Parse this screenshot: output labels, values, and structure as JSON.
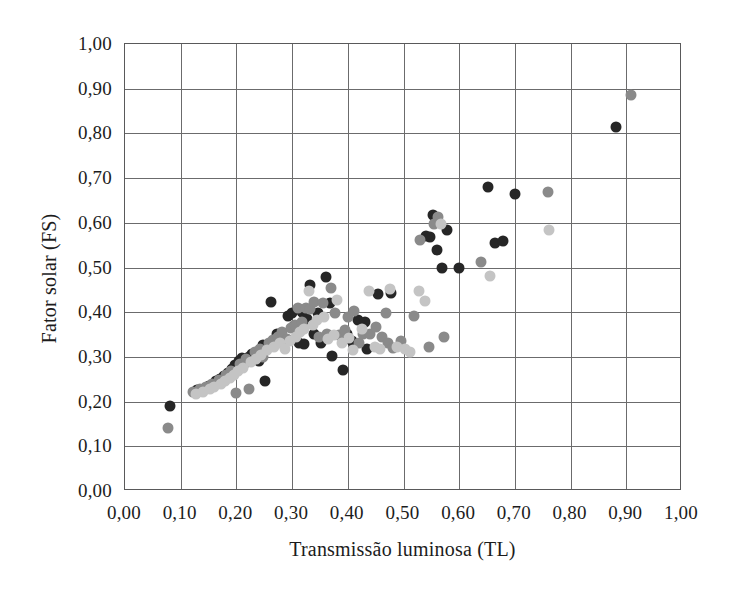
{
  "chart_data": {
    "type": "scatter",
    "title": "",
    "xlabel": "Transmissão luminosa (TL)",
    "ylabel": "Fator solar (FS)",
    "xlim": [
      0.0,
      1.0
    ],
    "ylim": [
      0.0,
      1.0
    ],
    "xticks": [
      "0,00",
      "0,10",
      "0,20",
      "0,30",
      "0,40",
      "0,50",
      "0,60",
      "0,70",
      "0,80",
      "0,90",
      "1,00"
    ],
    "yticks": [
      "0,00",
      "0,10",
      "0,20",
      "0,30",
      "0,40",
      "0,50",
      "0,60",
      "0,70",
      "0,80",
      "0,90",
      "1,00"
    ],
    "xtick_values": [
      0.0,
      0.1,
      0.2,
      0.3,
      0.4,
      0.5,
      0.6,
      0.7,
      0.8,
      0.9,
      1.0
    ],
    "ytick_values": [
      0.0,
      0.1,
      0.2,
      0.3,
      0.4,
      0.5,
      0.6,
      0.7,
      0.8,
      0.9,
      1.0
    ],
    "grid": true,
    "legend": "none",
    "marker_size_px": 11,
    "colors": {
      "dark": "#262626",
      "medium": "#8a8a8a",
      "light": "#c4c4c4",
      "frame": "#59595a",
      "gridline": "#6b6b6c",
      "text": "#1c1c1c",
      "background": "#ffffff"
    },
    "series": [
      {
        "name": "dark",
        "color": "#262626",
        "points": [
          [
            0.08,
            0.19
          ],
          [
            0.13,
            0.225
          ],
          [
            0.15,
            0.235
          ],
          [
            0.163,
            0.245
          ],
          [
            0.17,
            0.25
          ],
          [
            0.178,
            0.258
          ],
          [
            0.185,
            0.265
          ],
          [
            0.192,
            0.272
          ],
          [
            0.198,
            0.282
          ],
          [
            0.205,
            0.29
          ],
          [
            0.21,
            0.297
          ],
          [
            0.213,
            0.285
          ],
          [
            0.222,
            0.3
          ],
          [
            0.228,
            0.307
          ],
          [
            0.24,
            0.29
          ],
          [
            0.247,
            0.327
          ],
          [
            0.252,
            0.245
          ],
          [
            0.262,
            0.422
          ],
          [
            0.272,
            0.352
          ],
          [
            0.285,
            0.33
          ],
          [
            0.292,
            0.392
          ],
          [
            0.3,
            0.398
          ],
          [
            0.303,
            0.37
          ],
          [
            0.312,
            0.33
          ],
          [
            0.318,
            0.4
          ],
          [
            0.322,
            0.328
          ],
          [
            0.327,
            0.385
          ],
          [
            0.333,
            0.46
          ],
          [
            0.34,
            0.352
          ],
          [
            0.347,
            0.398
          ],
          [
            0.352,
            0.33
          ],
          [
            0.36,
            0.478
          ],
          [
            0.368,
            0.42
          ],
          [
            0.372,
            0.302
          ],
          [
            0.392,
            0.27
          ],
          [
            0.398,
            0.352
          ],
          [
            0.407,
            0.335
          ],
          [
            0.418,
            0.382
          ],
          [
            0.43,
            0.378
          ],
          [
            0.435,
            0.318
          ],
          [
            0.455,
            0.44
          ],
          [
            0.478,
            0.443
          ],
          [
            0.54,
            0.57
          ],
          [
            0.548,
            0.568
          ],
          [
            0.553,
            0.618
          ],
          [
            0.56,
            0.54
          ],
          [
            0.57,
            0.5
          ],
          [
            0.578,
            0.585
          ],
          [
            0.6,
            0.5
          ],
          [
            0.652,
            0.68
          ],
          [
            0.665,
            0.555
          ],
          [
            0.678,
            0.56
          ],
          [
            0.7,
            0.665
          ],
          [
            0.882,
            0.815
          ]
        ]
      },
      {
        "name": "medium",
        "color": "#8a8a8a",
        "points": [
          [
            0.078,
            0.142
          ],
          [
            0.122,
            0.222
          ],
          [
            0.135,
            0.228
          ],
          [
            0.145,
            0.232
          ],
          [
            0.157,
            0.24
          ],
          [
            0.168,
            0.248
          ],
          [
            0.175,
            0.245
          ],
          [
            0.182,
            0.26
          ],
          [
            0.19,
            0.268
          ],
          [
            0.2,
            0.22
          ],
          [
            0.207,
            0.285
          ],
          [
            0.218,
            0.295
          ],
          [
            0.223,
            0.228
          ],
          [
            0.233,
            0.312
          ],
          [
            0.242,
            0.318
          ],
          [
            0.248,
            0.3
          ],
          [
            0.258,
            0.33
          ],
          [
            0.265,
            0.338
          ],
          [
            0.275,
            0.345
          ],
          [
            0.282,
            0.355
          ],
          [
            0.29,
            0.34
          ],
          [
            0.298,
            0.365
          ],
          [
            0.305,
            0.372
          ],
          [
            0.31,
            0.41
          ],
          [
            0.318,
            0.378
          ],
          [
            0.325,
            0.41
          ],
          [
            0.333,
            0.408
          ],
          [
            0.34,
            0.422
          ],
          [
            0.348,
            0.345
          ],
          [
            0.355,
            0.42
          ],
          [
            0.362,
            0.352
          ],
          [
            0.37,
            0.455
          ],
          [
            0.377,
            0.398
          ],
          [
            0.385,
            0.348
          ],
          [
            0.395,
            0.36
          ],
          [
            0.4,
            0.39
          ],
          [
            0.412,
            0.402
          ],
          [
            0.42,
            0.33
          ],
          [
            0.428,
            0.352
          ],
          [
            0.44,
            0.352
          ],
          [
            0.45,
            0.368
          ],
          [
            0.462,
            0.345
          ],
          [
            0.468,
            0.398
          ],
          [
            0.472,
            0.33
          ],
          [
            0.482,
            0.32
          ],
          [
            0.495,
            0.335
          ],
          [
            0.518,
            0.392
          ],
          [
            0.53,
            0.562
          ],
          [
            0.545,
            0.322
          ],
          [
            0.555,
            0.598
          ],
          [
            0.562,
            0.612
          ],
          [
            0.572,
            0.345
          ],
          [
            0.64,
            0.512
          ],
          [
            0.76,
            0.67
          ],
          [
            0.908,
            0.885
          ]
        ]
      },
      {
        "name": "light",
        "color": "#c4c4c4",
        "points": [
          [
            0.128,
            0.218
          ],
          [
            0.14,
            0.222
          ],
          [
            0.152,
            0.228
          ],
          [
            0.16,
            0.232
          ],
          [
            0.172,
            0.24
          ],
          [
            0.18,
            0.245
          ],
          [
            0.188,
            0.252
          ],
          [
            0.196,
            0.26
          ],
          [
            0.203,
            0.268
          ],
          [
            0.212,
            0.275
          ],
          [
            0.226,
            0.288
          ],
          [
            0.236,
            0.296
          ],
          [
            0.245,
            0.305
          ],
          [
            0.255,
            0.315
          ],
          [
            0.268,
            0.322
          ],
          [
            0.278,
            0.33
          ],
          [
            0.288,
            0.318
          ],
          [
            0.296,
            0.336
          ],
          [
            0.307,
            0.345
          ],
          [
            0.315,
            0.355
          ],
          [
            0.322,
            0.362
          ],
          [
            0.33,
            0.448
          ],
          [
            0.338,
            0.372
          ],
          [
            0.345,
            0.382
          ],
          [
            0.358,
            0.39
          ],
          [
            0.365,
            0.34
          ],
          [
            0.375,
            0.348
          ],
          [
            0.38,
            0.428
          ],
          [
            0.39,
            0.33
          ],
          [
            0.403,
            0.342
          ],
          [
            0.41,
            0.315
          ],
          [
            0.425,
            0.362
          ],
          [
            0.438,
            0.448
          ],
          [
            0.448,
            0.322
          ],
          [
            0.458,
            0.318
          ],
          [
            0.475,
            0.452
          ],
          [
            0.488,
            0.322
          ],
          [
            0.502,
            0.318
          ],
          [
            0.512,
            0.312
          ],
          [
            0.528,
            0.448
          ],
          [
            0.538,
            0.425
          ],
          [
            0.568,
            0.598
          ],
          [
            0.655,
            0.48
          ],
          [
            0.762,
            0.585
          ]
        ]
      }
    ]
  }
}
